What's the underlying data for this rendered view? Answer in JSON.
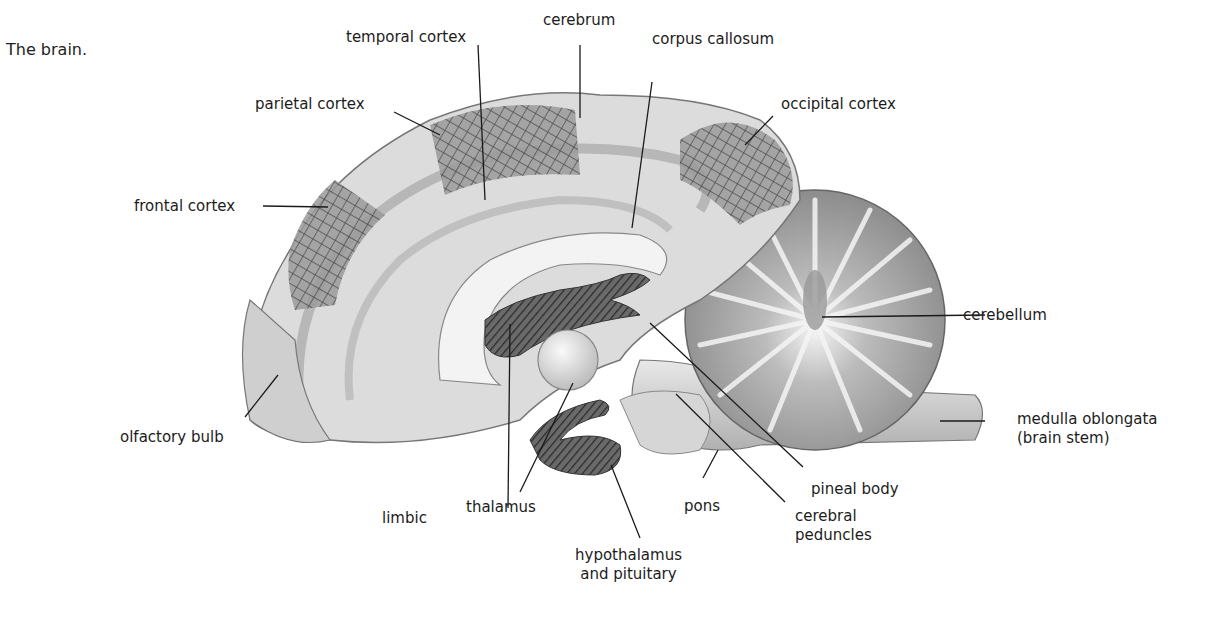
{
  "caption": "The brain.",
  "diagram": {
    "labels": [
      {
        "id": "cerebrum",
        "text": "cerebrum"
      },
      {
        "id": "temporal_cortex",
        "text": "temporal cortex"
      },
      {
        "id": "corpus_callosum",
        "text": "corpus callosum"
      },
      {
        "id": "parietal_cortex",
        "text": "parietal cortex"
      },
      {
        "id": "occipital_cortex",
        "text": "occipital cortex"
      },
      {
        "id": "frontal_cortex",
        "text": "frontal cortex"
      },
      {
        "id": "cerebellum",
        "text": "cerebellum"
      },
      {
        "id": "medulla_oblongata",
        "text": "medulla oblongata",
        "text2": "(brain stem)"
      },
      {
        "id": "olfactory_bulb",
        "text": "olfactory bulb"
      },
      {
        "id": "pineal_body",
        "text": "pineal body"
      },
      {
        "id": "limbic",
        "text": "limbic"
      },
      {
        "id": "thalamus",
        "text": "thalamus"
      },
      {
        "id": "pons",
        "text": "pons"
      },
      {
        "id": "cerebral_peduncles",
        "text": "cerebral",
        "text2": "peduncles"
      },
      {
        "id": "hypothalamus_pituitary",
        "text": "hypothalamus",
        "text2": "and pituitary"
      }
    ]
  }
}
